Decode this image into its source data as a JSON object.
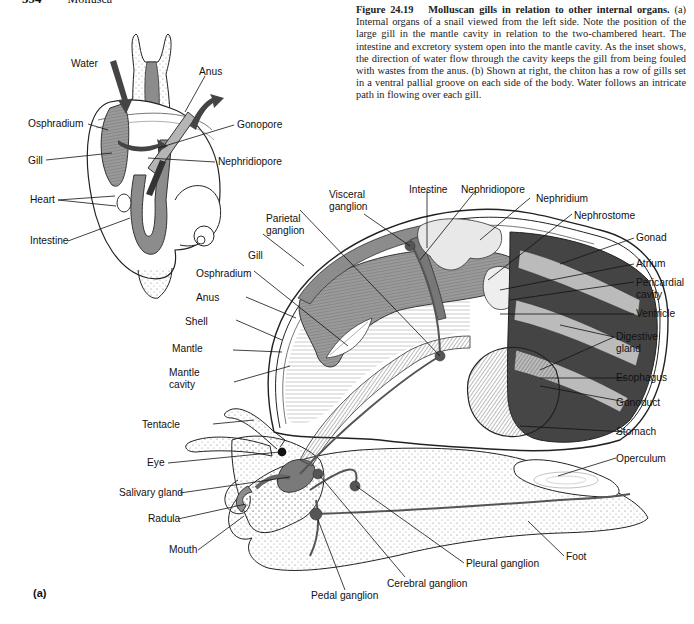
{
  "page": {
    "running_head_number": "594",
    "running_head_section": "Mollusca"
  },
  "caption": {
    "figure_number": "Figure 24.19",
    "title": "Molluscan gills in relation to other internal organs.",
    "body": "(a) Internal organs of a snail viewed from the left side. Note the position of the large gill in the mantle cavity in relation to the two-chambered heart. The intestine and excretory system open into the mantle cavity. As the inset shows, the direction of water flow through the cavity keeps the gill from being fouled with wastes from the anus. (b) Shown at right, the chiton has a row of gills set in a ventral pallial groove on each side of the body. Water follows an intricate path in flowing over each gill."
  },
  "inset_labels": {
    "water": "Water",
    "anus": "Anus",
    "osphradium": "Osphradium",
    "gonopore": "Gonopore",
    "gill": "Gill",
    "nephridiopore": "Nephridiopore",
    "heart": "Heart",
    "intestine": "Intestine"
  },
  "main_labels": {
    "visceral_ganglion": [
      "Visceral",
      "ganglion"
    ],
    "intestine": "Intestine",
    "nephridiopore": "Nephridiopore",
    "nephridium": "Nephridium",
    "nephrostome": "Nephrostome",
    "parietal_ganglion": [
      "Parietal",
      "ganglion"
    ],
    "gonad": "Gonad",
    "gill": "Gill",
    "atrium": "Atrium",
    "osphradium": "Osphradium",
    "pericardial_cavity": [
      "Pericardial",
      "cavity"
    ],
    "anus": "Anus",
    "ventricle": "Ventricle",
    "shell": "Shell",
    "digestive_gland": [
      "Digestive",
      "gland"
    ],
    "mantle": "Mantle",
    "mantle_cavity": [
      "Mantle",
      "cavity"
    ],
    "esophagus": "Esophagus",
    "gonoduct": "Gonoduct",
    "tentacle": "Tentacle",
    "stomach": "Stomach",
    "eye": "Eye",
    "operculum": "Operculum",
    "salivary_gland": "Salivary gland",
    "radula": "Radula",
    "mouth": "Mouth",
    "pleural_ganglion": "Pleural ganglion",
    "foot": "Foot",
    "cerebral_ganglion": "Cerebral ganglion",
    "pedal_ganglion": "Pedal ganglion"
  },
  "panel_letter": "(a)",
  "colors": {
    "ink": "#111111",
    "organ_gray": "#8c8c8c",
    "dark_gray": "#4a4a4a",
    "light_gray": "#d4d4d4",
    "arrow": "#555555"
  }
}
